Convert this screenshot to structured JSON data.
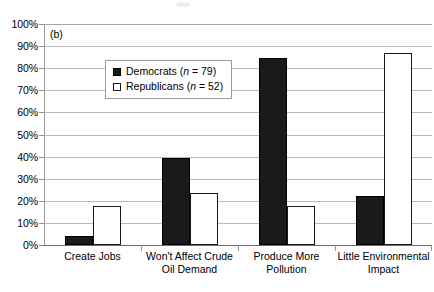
{
  "figure": {
    "panel_label": "(b)"
  },
  "legend": {
    "entries": [
      {
        "swatch": "filled-black-square",
        "label": "Democrats",
        "n_prefix": "n",
        "n_equals": " = ",
        "n_value": "79",
        "full": "Democrats (n = 79)"
      },
      {
        "swatch": "open-white-square",
        "label": "Republicans",
        "n_prefix": "n",
        "n_equals": " = ",
        "n_value": "52",
        "full": "Republicans (n = 52)"
      }
    ]
  },
  "axis": {
    "y_ticks": [
      "100%",
      "90%",
      "80%",
      "70%",
      "60%",
      "50%",
      "40%",
      "30%",
      "20%",
      "10%",
      "0%"
    ]
  },
  "categories": [
    {
      "line1": "Create Jobs",
      "line2": ""
    },
    {
      "line1": "Won't Affect Crude",
      "line2": "Oil Demand"
    },
    {
      "line1": "Produce More",
      "line2": "Pollution"
    },
    {
      "line1": "Little Environmental",
      "line2": "Impact"
    }
  ],
  "colors": {
    "democrats": "#1a1a1a",
    "republicans": "#ffffff",
    "republicans_border": "#1a1a1a",
    "gridline": "#b9b9b9",
    "axis": "#9a9a9a",
    "baseline": "#6b6b6b",
    "text": "#000000",
    "background": "#ffffff"
  },
  "chart_data": {
    "type": "bar",
    "title": "",
    "subtitle": "",
    "xlabel": "",
    "ylabel": "",
    "ylim": [
      0,
      100
    ],
    "y_tick_values": [
      0,
      10,
      20,
      30,
      40,
      50,
      60,
      70,
      80,
      90,
      100
    ],
    "y_tick_labels": [
      "0%",
      "10%",
      "20%",
      "30%",
      "40%",
      "50%",
      "60%",
      "70%",
      "80%",
      "90%",
      "100%"
    ],
    "grid": true,
    "legend_position": "upper-left-inside",
    "annotations": [
      "(b)"
    ],
    "categories": [
      "Create Jobs",
      "Won't Affect Crude Oil Demand",
      "Produce More Pollution",
      "Little Environmental Impact"
    ],
    "series": [
      {
        "name": "Democrats (n = 79)",
        "n": 79,
        "color": "#1a1a1a",
        "values": [
          4,
          39.5,
          84.5,
          22
        ]
      },
      {
        "name": "Republicans (n = 52)",
        "n": 52,
        "color": "#ffffff",
        "values": [
          17.5,
          23.5,
          17.5,
          87
        ]
      }
    ]
  }
}
